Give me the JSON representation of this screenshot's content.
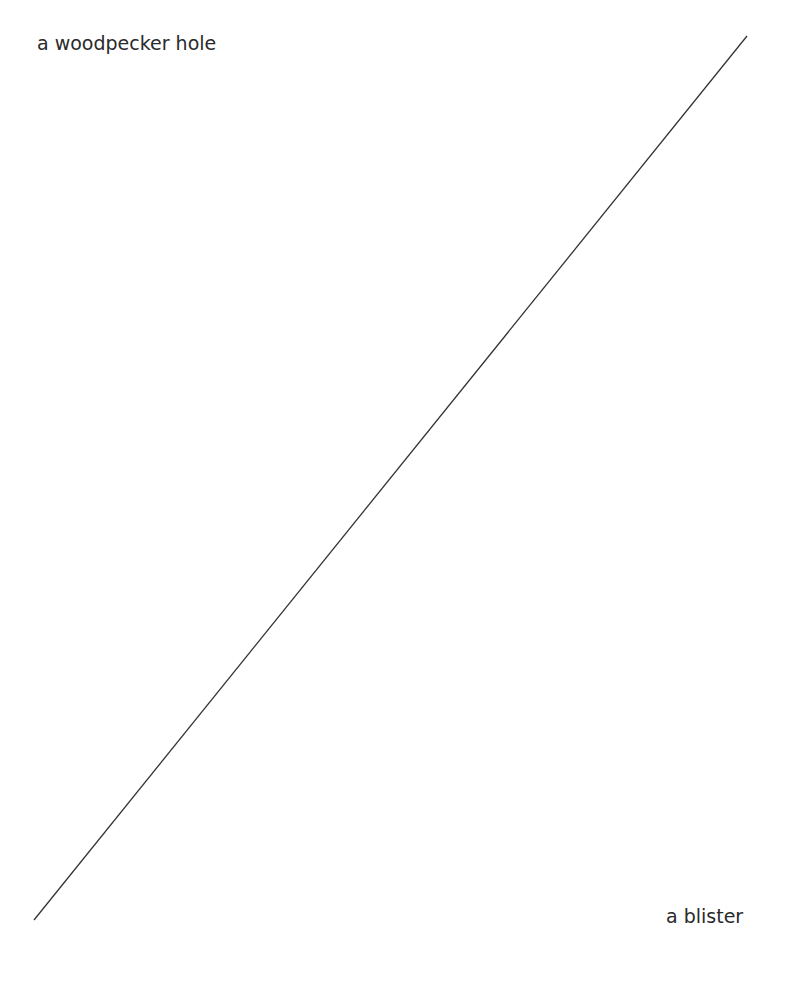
{
  "diagram": {
    "top_left_label": "a woodpecker hole",
    "bottom_right_label": "a blister",
    "line": {
      "x1": 747,
      "y1": 36,
      "x2": 34,
      "y2": 920,
      "color": "#333333"
    }
  }
}
